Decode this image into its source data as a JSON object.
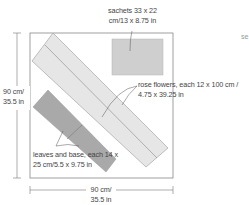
{
  "diagram": {
    "type": "cutting-layout",
    "fabric": {
      "width_label_line1": "90 cm/",
      "width_label_line2": "35.5 in",
      "height_label_line1": "90 cm/",
      "height_label_line2": "35.5 in"
    },
    "pieces": [
      {
        "id": "sachets",
        "label_line1": "sachets 33 x 22",
        "label_line2": "cm/13 x 8.75 in",
        "color": "#cfcfcf"
      },
      {
        "id": "rose-flowers",
        "label_line1": "rose flowers, each 12 x 100 cm /",
        "label_line2": "4.75 x 39.25 in",
        "color": "#e6e6e6"
      },
      {
        "id": "leaves-and-base",
        "label_line1": "leaves and base, each 14 x",
        "label_line2": "25 cm/5.5 x 9.75 in",
        "color": "#a9a9a9"
      }
    ],
    "edge_text": "se",
    "colors": {
      "outline": "#777777",
      "text": "#444444"
    }
  }
}
